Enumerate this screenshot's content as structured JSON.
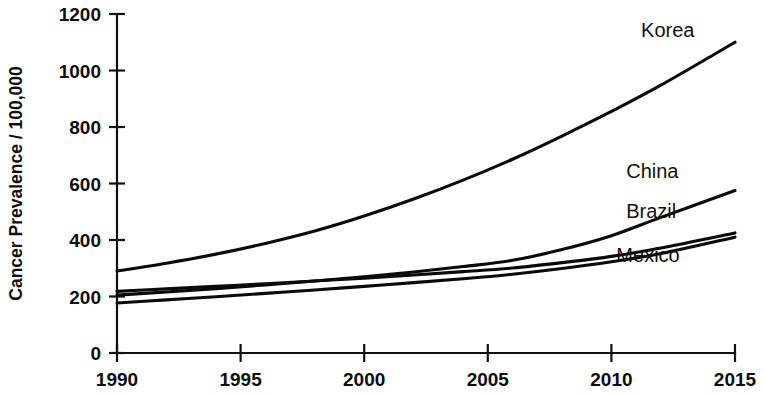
{
  "chart_data": {
    "type": "line",
    "title": "",
    "subtitle": "",
    "xlabel": "",
    "ylabel": "Cancer Prevalence / 100,000",
    "xlim": [
      1990,
      2015
    ],
    "ylim": [
      0,
      1200
    ],
    "x_ticks": [
      1990,
      1995,
      2000,
      2005,
      2010,
      2015
    ],
    "x_tick_labels": [
      "1990",
      "1995",
      "2000",
      "2005",
      "2010",
      "2015"
    ],
    "y_ticks": [
      0,
      200,
      400,
      600,
      800,
      1000,
      1200
    ],
    "y_tick_labels": [
      "0",
      "200",
      "400",
      "600",
      "800",
      "1000",
      "1200"
    ],
    "grid": false,
    "legend_position": "right-inline-labels",
    "x": [
      1990,
      1992,
      1994,
      1996,
      1998,
      2000,
      2002,
      2004,
      2006,
      2008,
      2010,
      2012,
      2015
    ],
    "series": [
      {
        "name": "Korea",
        "label": "Korea",
        "color": "#0a0a0a",
        "values": [
          290,
          318,
          350,
          388,
          432,
          485,
          545,
          612,
          686,
          768,
          855,
          948,
          1100
        ],
        "label_x": 2011.2,
        "label_y": 1120
      },
      {
        "name": "China",
        "label": "China",
        "color": "#0a0a0a",
        "values": [
          205,
          216,
          228,
          241,
          255,
          270,
          287,
          306,
          328,
          366,
          415,
          480,
          575
        ],
        "label_x": 2010.6,
        "label_y": 620
      },
      {
        "name": "Brazil",
        "label": "Brazil",
        "color": "#0a0a0a",
        "values": [
          218,
          227,
          236,
          245,
          255,
          265,
          276,
          288,
          301,
          320,
          342,
          372,
          425
        ],
        "label_x": 2010.6,
        "label_y": 478
      },
      {
        "name": "Mexico",
        "label": "Mexico",
        "color": "#0a0a0a",
        "values": [
          177,
          188,
          199,
          211,
          223,
          236,
          249,
          263,
          279,
          299,
          323,
          352,
          410
        ],
        "label_x": 2010.2,
        "label_y": 322
      }
    ]
  },
  "axes": {
    "y_title": "Cancer Prevalence / 100,000"
  }
}
